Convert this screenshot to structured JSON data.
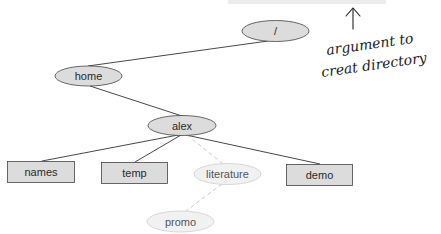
{
  "diagram": {
    "type": "directory-tree",
    "colors": {
      "node_fill": "#dcdcdc",
      "node_stroke": "#444444",
      "faded_fill": "#f1f1f1",
      "faded_stroke": "#cfcfcf",
      "edge": "#333333",
      "dashed_edge": "#c8c8c8",
      "top_bar": "#ececec"
    },
    "nodes": [
      {
        "id": "root",
        "label": "/",
        "shape": "ellipse",
        "style": "solid"
      },
      {
        "id": "home",
        "label": "home",
        "shape": "ellipse",
        "style": "solid"
      },
      {
        "id": "alex",
        "label": "alex",
        "shape": "ellipse",
        "style": "solid"
      },
      {
        "id": "names",
        "label": "names",
        "shape": "rect",
        "style": "solid"
      },
      {
        "id": "temp",
        "label": "temp",
        "shape": "rect",
        "style": "solid"
      },
      {
        "id": "literature",
        "label": "literature",
        "shape": "ellipse",
        "style": "faded"
      },
      {
        "id": "demo",
        "label": "demo",
        "shape": "rect",
        "style": "solid"
      },
      {
        "id": "promo",
        "label": "promo",
        "shape": "ellipse",
        "style": "faded"
      }
    ],
    "edges": [
      {
        "from": "root",
        "to": "home",
        "style": "solid"
      },
      {
        "from": "home",
        "to": "alex",
        "style": "solid"
      },
      {
        "from": "alex",
        "to": "names",
        "style": "solid"
      },
      {
        "from": "alex",
        "to": "temp",
        "style": "solid"
      },
      {
        "from": "alex",
        "to": "literature",
        "style": "dashed"
      },
      {
        "from": "alex",
        "to": "demo",
        "style": "solid"
      },
      {
        "from": "literature",
        "to": "promo",
        "style": "dashed"
      }
    ]
  },
  "annotation": {
    "line1": "argument to",
    "line2": "creat directory",
    "arrow": "up-arrow"
  }
}
